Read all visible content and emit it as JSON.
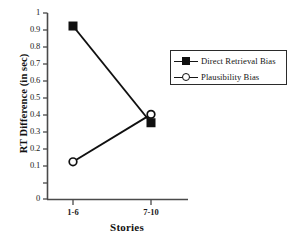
{
  "chart_data": {
    "type": "line",
    "title": "",
    "xlabel": "Stories",
    "ylabel": "RT Difference (in sec)",
    "categories": [
      "1-6",
      "7-10"
    ],
    "ylim": [
      0,
      1
    ],
    "yticks": [
      "0",
      "0.1",
      "0.2",
      "0.3",
      "0.4",
      "0.5",
      "0.6",
      "0.7",
      "0.8",
      "0.9",
      "1"
    ],
    "ytick_values": [
      0,
      0.1,
      0.2,
      0.3,
      0.4,
      0.5,
      0.6,
      0.7,
      0.8,
      0.9,
      1
    ],
    "grid": false,
    "legend_position": "top-right",
    "series": [
      {
        "name": "Direct Retrieval Bias",
        "marker": "filled-square",
        "color": "#101010",
        "values": [
          0.93,
          0.41
        ]
      },
      {
        "name": "Plausibility Bias",
        "marker": "open-circle",
        "color": "#101010",
        "values": [
          0.2,
          0.455
        ]
      }
    ]
  },
  "axes": {
    "y_label": "RT Difference (in sec)",
    "x_label": "Stories",
    "y_tick_labels": [
      "1",
      "0.9",
      "0.8",
      "0.7",
      "0.6",
      "0.5",
      "0.4",
      "0.3",
      "0.2",
      "0.1",
      "0"
    ],
    "x_tick_labels": [
      "1-6",
      "7-10"
    ]
  },
  "legend": {
    "entries": [
      {
        "label": "Direct Retrieval Bias",
        "marker": "filled-square"
      },
      {
        "label": "Plausibility Bias",
        "marker": "open-circle"
      }
    ]
  },
  "colors": {
    "axis": "#4a4a4a",
    "series": "#101010",
    "background": "#ffffff",
    "legend_border": "#2b2b2b"
  }
}
